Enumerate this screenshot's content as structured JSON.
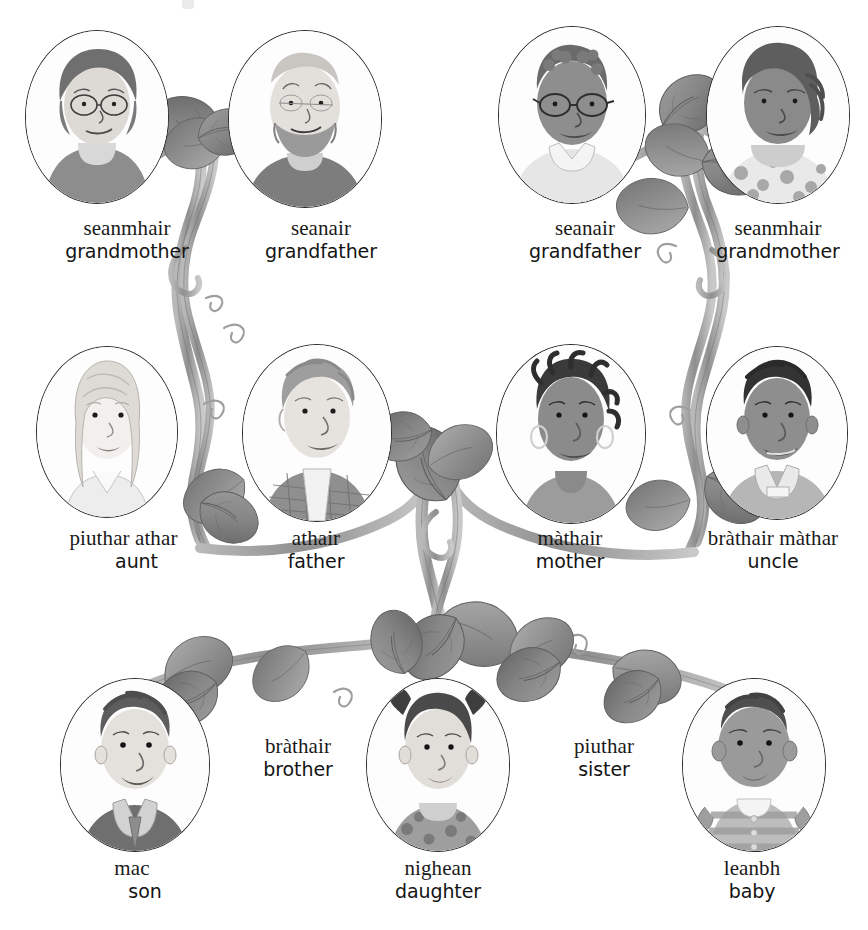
{
  "page": {
    "background_color": "#ffffff",
    "ink_color": "#2b2b2b",
    "vine_color": "#9a9a9a",
    "leaf_color": "#8e8e8e",
    "width": 868,
    "height": 930
  },
  "tree": {
    "generations": [
      {
        "name": "grandparents",
        "people": [
          {
            "id": "grandmother-paternal",
            "gaelic": "seanmhair",
            "english": "grandmother",
            "portrait": "elderly-woman-glasses-bob-hair"
          },
          {
            "id": "grandfather-paternal",
            "gaelic": "seanair",
            "english": "grandfather",
            "portrait": "elderly-man-beard-bald"
          },
          {
            "id": "grandfather-maternal",
            "gaelic": "seanair",
            "english": "grandfather",
            "portrait": "elderly-man-glasses-dark-skin"
          },
          {
            "id": "grandmother-maternal",
            "gaelic": "seanmhair",
            "english": "grandmother",
            "portrait": "elderly-woman-curly-hair-patterned-top"
          }
        ]
      },
      {
        "name": "parents",
        "people": [
          {
            "id": "aunt",
            "gaelic": "piuthar athar",
            "english": "aunt",
            "portrait": "young-woman-long-blonde-hair"
          },
          {
            "id": "father",
            "gaelic": "athair",
            "english": "father",
            "portrait": "man-tousled-hair-plaid-shirt"
          },
          {
            "id": "mother",
            "gaelic": "màthair",
            "english": "mother",
            "portrait": "woman-braids-hoop-earrings"
          },
          {
            "id": "uncle",
            "gaelic": "bràthair màthar",
            "english": "uncle",
            "portrait": "man-short-hair-collared-jacket"
          }
        ]
      },
      {
        "name": "children",
        "people": [
          {
            "id": "son",
            "gaelic": "mac",
            "english": "son",
            "portrait": "boy-dark-hair-collared-shirt"
          },
          {
            "id": "daughter",
            "gaelic": "nighean",
            "english": "daughter",
            "portrait": "girl-pigtails-spotted-top"
          },
          {
            "id": "baby",
            "gaelic": "leanbh",
            "english": "baby",
            "portrait": "baby-striped-romper"
          }
        ],
        "sibling_terms": [
          {
            "id": "brother",
            "gaelic": "bràthair",
            "english": "brother"
          },
          {
            "id": "sister",
            "gaelic": "piuthar",
            "english": "sister"
          }
        ]
      }
    ]
  }
}
